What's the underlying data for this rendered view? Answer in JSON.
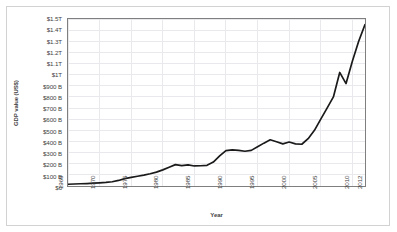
{
  "chart_data": {
    "type": "line",
    "title": "",
    "xlabel": "Year",
    "ylabel": "GDP value (US$)",
    "xlim": [
      1965,
      2012
    ],
    "ylim": [
      0,
      1500
    ],
    "y_unit": "billions of US dollars",
    "grid": true,
    "legend": null,
    "line_color": "#1a1a1a",
    "ytick_values": [
      0,
      100,
      200,
      300,
      400,
      500,
      600,
      700,
      800,
      900,
      1000,
      1100,
      1200,
      1300,
      1400,
      1500
    ],
    "ytick_labels": [
      "$0",
      "$100 B",
      "$200 B",
      "$300 B",
      "$400 B",
      "$500 B",
      "$600 B",
      "$700 B",
      "$800 B",
      "$900 B",
      "$1T",
      "$1.1T",
      "$1.2T",
      "$1.3T",
      "$1.4T",
      "$1.5T"
    ],
    "xtick_values": [
      1965,
      1970,
      1975,
      1980,
      1985,
      1990,
      1995,
      2000,
      2005,
      2010,
      2012
    ],
    "xtick_labels": [
      "1965",
      "1970",
      "1975",
      "1980",
      "1985",
      "1990",
      "1995",
      "2000",
      "2005",
      "2010",
      "2012"
    ],
    "x": [
      1965,
      1966,
      1967,
      1968,
      1969,
      1970,
      1971,
      1972,
      1973,
      1974,
      1975,
      1976,
      1977,
      1978,
      1979,
      1980,
      1981,
      1982,
      1983,
      1984,
      1985,
      1986,
      1987,
      1988,
      1989,
      1990,
      1991,
      1992,
      1993,
      1994,
      1995,
      1996,
      1997,
      1998,
      1999,
      2000,
      2001,
      2002,
      2003,
      2004,
      2005,
      2006,
      2007,
      2008,
      2009,
      2010,
      2011,
      2012
    ],
    "values": [
      16,
      18,
      20,
      22,
      25,
      28,
      32,
      38,
      50,
      66,
      78,
      88,
      98,
      110,
      125,
      145,
      168,
      192,
      183,
      190,
      180,
      182,
      186,
      215,
      270,
      318,
      325,
      320,
      312,
      320,
      352,
      385,
      415,
      398,
      378,
      395,
      378,
      375,
      425,
      500,
      600,
      700,
      800,
      1020,
      920,
      1120,
      1300,
      1450
    ]
  }
}
